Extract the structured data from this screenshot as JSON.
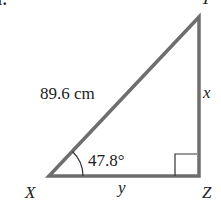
{
  "figure": {
    "problem_marker": "r.",
    "triangle": {
      "vertices": {
        "X": {
          "label": "X",
          "x": 49,
          "y": 176
        },
        "Y": {
          "label": "Y",
          "x": 199,
          "y": 17
        },
        "Z": {
          "label": "Z",
          "x": 199,
          "y": 176
        }
      },
      "sides": {
        "hypotenuse": {
          "label": "89.6 cm",
          "from": "X",
          "to": "Y"
        },
        "vertical": {
          "label": "x",
          "from": "Z",
          "to": "Y"
        },
        "base": {
          "label": "y",
          "from": "X",
          "to": "Z"
        }
      },
      "angle_X": {
        "label": "47.8°"
      },
      "right_angle_at": "Z"
    },
    "colors": {
      "stroke": "#6e6e6e",
      "text": "#222222",
      "background": "#ffffff"
    }
  }
}
